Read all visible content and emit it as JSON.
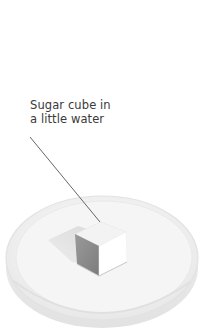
{
  "figure": {
    "label": {
      "line1": "Sugar cube in",
      "line2": "a little water"
    },
    "objects": {
      "dish": "petri-dish",
      "cube": "sugar-cube",
      "leader_line": "callout-line"
    },
    "colors": {
      "background": "#ffffff",
      "text": "#3a3a3a",
      "leader_line": "#555555",
      "dish_rim": "#e6e6e6",
      "dish_inner": "#f1f1f1",
      "cube_top": "#f4f4f4",
      "cube_left": "#8e8e8e",
      "cube_right": "#ffffff",
      "cube_shadow": "#d9d9d9"
    }
  }
}
